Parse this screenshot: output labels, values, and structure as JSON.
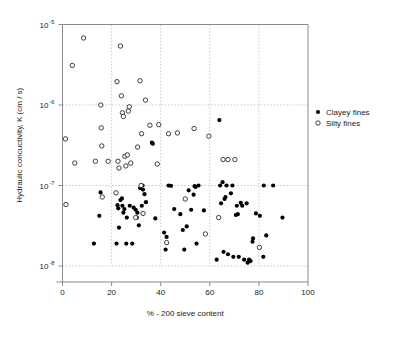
{
  "chart_data": {
    "type": "scatter",
    "title": "",
    "xlabel": "% - 200 sieve content",
    "ylabel": "Hydraulic concuctivity, K (cm / s)",
    "xlim": [
      0,
      100
    ],
    "ylim": [
      1e-08,
      1e-05
    ],
    "yscale": "log",
    "xscale": "linear",
    "grid": true,
    "xticks": [
      0,
      20,
      40,
      60,
      80,
      100
    ],
    "xticklabels": [
      "0",
      "20",
      "40",
      "60",
      "80",
      "100"
    ],
    "yticks": [
      1e-05,
      1e-06,
      1e-07,
      1e-08
    ],
    "yticklabels": [
      "10",
      "10",
      "10",
      "10"
    ],
    "yticklabel_exponents": [
      "-5",
      "-6",
      "-7",
      "-8"
    ],
    "legend_position": "right",
    "series": [
      {
        "name": "Clayey fines",
        "marker": "filled-circle",
        "color": "#000000",
        "points": [
          [
            12.8,
            1.9e-08
          ],
          [
            15.5,
            8.2e-08
          ],
          [
            15.0,
            4.2e-08
          ],
          [
            22.0,
            1.9e-08
          ],
          [
            22.4,
            5.7e-08
          ],
          [
            22.7,
            5.2e-08
          ],
          [
            23.0,
            3e-08
          ],
          [
            23.6,
            6.6e-08
          ],
          [
            24.2,
            6.9e-08
          ],
          [
            24.4,
            5.6e-08
          ],
          [
            24.8,
            4.6e-08
          ],
          [
            25.2,
            5.1e-08
          ],
          [
            26.0,
            1.9e-08
          ],
          [
            26.2,
            4e-08
          ],
          [
            27.4,
            5.6e-08
          ],
          [
            28.4,
            1.9e-08
          ],
          [
            29.0,
            5.3e-08
          ],
          [
            29.8,
            5e-08
          ],
          [
            30.3,
            4e-08
          ],
          [
            30.5,
            4.6e-08
          ],
          [
            31.1,
            3.2e-08
          ],
          [
            31.6,
            9.3e-08
          ],
          [
            32.3,
            5.6e-08
          ],
          [
            32.6,
            1e-07
          ],
          [
            32.8,
            8.9e-08
          ],
          [
            33.4,
            7.8e-08
          ],
          [
            34.0,
            6.2e-08
          ],
          [
            36.4,
            3.4e-07
          ],
          [
            36.8,
            3.3e-07
          ],
          [
            37.8,
            3.9e-08
          ],
          [
            41.4,
            2.6e-08
          ],
          [
            42.0,
            1.6e-08
          ],
          [
            42.4,
            2.3e-08
          ],
          [
            43.2,
            1e-07
          ],
          [
            44.2,
            9.9e-08
          ],
          [
            45.5,
            5.1e-08
          ],
          [
            48.0,
            4.4e-08
          ],
          [
            49.0,
            2.8e-08
          ],
          [
            49.6,
            1.6e-08
          ],
          [
            50.6,
            3.1e-08
          ],
          [
            51.4,
            8.7e-08
          ],
          [
            52.4,
            5e-08
          ],
          [
            53.4,
            7.7e-08
          ],
          [
            53.8,
            9.8e-08
          ],
          [
            54.2,
            9.6e-08
          ],
          [
            54.6,
            1.9e-08
          ],
          [
            55.4,
            1e-07
          ],
          [
            57.6,
            4.9e-08
          ],
          [
            62.8,
            1.2e-08
          ],
          [
            63.9,
            6.5e-07
          ],
          [
            64.2,
            1e-07
          ],
          [
            64.6,
            6e-08
          ],
          [
            65.2,
            1.1e-07
          ],
          [
            65.6,
            1.5e-08
          ],
          [
            66.0,
            6.8e-08
          ],
          [
            66.4,
            7.2e-08
          ],
          [
            66.8,
            1e-07
          ],
          [
            67.4,
            1.4e-08
          ],
          [
            68.6,
            8e-08
          ],
          [
            69.2,
            1e-07
          ],
          [
            69.6,
            1.3e-08
          ],
          [
            70.6,
            4.3e-08
          ],
          [
            71.0,
            5.6e-08
          ],
          [
            71.4,
            4.4e-08
          ],
          [
            71.8,
            1.3e-08
          ],
          [
            72.6,
            6.1e-08
          ],
          [
            73.2,
            5.6e-08
          ],
          [
            74.0,
            1.2e-08
          ],
          [
            75.0,
            6e-08
          ],
          [
            75.4,
            1.1e-08
          ],
          [
            76.0,
            1.2e-08
          ],
          [
            76.6,
            1.15e-08
          ],
          [
            77.4,
            2e-08
          ],
          [
            77.6,
            2.2e-08
          ],
          [
            78.8,
            4.5e-08
          ],
          [
            80.4,
            4.2e-08
          ],
          [
            81.8,
            1.3e-08
          ],
          [
            82.0,
            1e-07
          ],
          [
            83.0,
            2.4e-08
          ],
          [
            85.8,
            1e-07
          ],
          [
            89.6,
            4e-08
          ]
        ]
      },
      {
        "name": "Silty fines",
        "marker": "open-circle",
        "color": "#ffffff",
        "points": [
          [
            1.2,
            3.8e-07
          ],
          [
            1.4,
            5.8e-08
          ],
          [
            4.0,
            3.1e-06
          ],
          [
            5.0,
            1.9e-07
          ],
          [
            8.6,
            6.8e-06
          ],
          [
            13.4,
            2e-07
          ],
          [
            15.6,
            1e-06
          ],
          [
            15.8,
            5.2e-07
          ],
          [
            16.0,
            3.1e-07
          ],
          [
            16.2,
            7.2e-08
          ],
          [
            18.6,
            2e-07
          ],
          [
            21.8,
            8.1e-08
          ],
          [
            22.2,
            1.95e-06
          ],
          [
            22.6,
            2e-07
          ],
          [
            23.0,
            1.65e-07
          ],
          [
            23.6,
            5.4e-06
          ],
          [
            24.0,
            1.3e-06
          ],
          [
            24.4,
            8e-07
          ],
          [
            24.8,
            7.2e-07
          ],
          [
            25.4,
            2.3e-07
          ],
          [
            25.8,
            1.75e-07
          ],
          [
            26.4,
            2.4e-07
          ],
          [
            26.8,
            8.4e-07
          ],
          [
            27.2,
            9.5e-07
          ],
          [
            27.8,
            1.9e-07
          ],
          [
            29.8,
            4e-08
          ],
          [
            30.6,
            3e-07
          ],
          [
            31.6,
            2e-06
          ],
          [
            32.0,
            1e-07
          ],
          [
            32.2,
            4.4e-07
          ],
          [
            32.8,
            4.5e-08
          ],
          [
            33.8,
            1.15e-06
          ],
          [
            35.6,
            5.6e-07
          ],
          [
            38.6,
            1.85e-07
          ],
          [
            39.2,
            5.7e-07
          ],
          [
            42.4,
            1.95e-08
          ],
          [
            43.2,
            4.4e-07
          ],
          [
            46.8,
            4.5e-07
          ],
          [
            50.0,
            6.8e-08
          ],
          [
            53.6,
            5.1e-07
          ],
          [
            58.2,
            2.5e-08
          ],
          [
            59.6,
            4.1e-07
          ],
          [
            63.6,
            4e-08
          ],
          [
            65.4,
            2.1e-07
          ],
          [
            67.4,
            2.1e-07
          ],
          [
            70.2,
            2.1e-07
          ],
          [
            80.2,
            1.7e-08
          ]
        ]
      }
    ]
  },
  "legend": {
    "entries": [
      {
        "label": "Clayey fines",
        "marker": "filled-circle"
      },
      {
        "label": "Silty fines",
        "marker": "open-circle"
      }
    ]
  },
  "axes": {
    "x_title": "% - 200 sieve content",
    "y_title": "Hydraulic concuctivity, K (cm / s)"
  },
  "colors": {
    "clayey": "#000000",
    "silty_stroke": "#2b2b2b",
    "grid": "#b9b9b9",
    "axis": "#8a8a8a",
    "background": "#ffffff"
  }
}
